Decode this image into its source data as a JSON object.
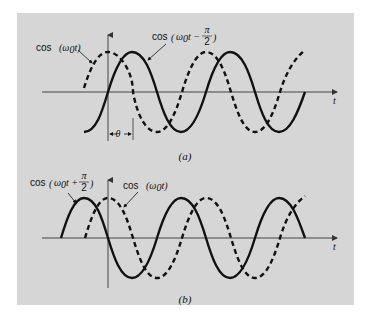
{
  "figure": {
    "background": "#d6d6d6",
    "panels": [
      {
        "id": "a",
        "caption": "(a)",
        "axis_label_t": "t",
        "curves": [
          {
            "name": "reference",
            "label_fn": "cos",
            "label_arg": "(ω0t)",
            "style": "dashed",
            "phase": "0"
          },
          {
            "name": "lagging",
            "label_fn": "cos",
            "label_arg": "ω0t −",
            "label_frac_num": "π",
            "label_frac_den": "2",
            "style": "solid",
            "phase": "-π/2"
          }
        ],
        "annotation": {
          "symbol": "θ",
          "meaning": "phase shift between curves"
        }
      },
      {
        "id": "b",
        "caption": "(b)",
        "axis_label_t": "t",
        "curves": [
          {
            "name": "leading",
            "label_fn": "cos",
            "label_arg": "ω0t +",
            "label_frac_num": "π",
            "label_frac_den": "2",
            "style": "solid",
            "phase": "+π/2"
          },
          {
            "name": "reference",
            "label_fn": "cos",
            "label_arg": "(ω0t)",
            "style": "dashed",
            "phase": "0"
          }
        ]
      }
    ]
  },
  "labels": {
    "a_cos_ref": "cos",
    "a_cos_ref_arg_omega": "(ω",
    "a_cos_ref_arg_sub": "0",
    "a_cos_ref_arg_t": "t)",
    "a_cos_lag": "cos",
    "a_cos_lag_omega": "ω",
    "a_cos_lag_sub": "0",
    "a_cos_lag_t": "t −",
    "a_frac_num": "π",
    "a_frac_den": "2",
    "a_t": "t",
    "a_theta": "θ",
    "a_caption": "(a)",
    "b_cos_lead": "cos",
    "b_cos_lead_omega": "ω",
    "b_cos_lead_sub": "0",
    "b_cos_lead_t": "t +",
    "b_frac_num": "π",
    "b_frac_den": "2",
    "b_cos_ref": "cos",
    "b_cos_ref_arg_omega": "(ω",
    "b_cos_ref_arg_sub": "0",
    "b_cos_ref_arg_t": "t)",
    "b_t": "t",
    "b_caption": "(b)"
  }
}
